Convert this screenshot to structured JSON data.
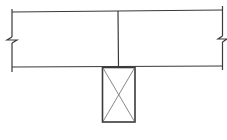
{
  "diagram": {
    "type": "structural-detail",
    "stroke_color": "#3a3a3a",
    "light_stroke_color": "#6a6a6a",
    "background": "#ffffff",
    "beam": {
      "left_x": 12,
      "right_x": 223,
      "top_left_y": 12,
      "top_right_y": 10,
      "bottom_y": 67,
      "center_joint_x": 118,
      "break_symbol_y_left": 40,
      "break_symbol_y_right": 39
    },
    "post": {
      "left_x": 102,
      "right_x": 135,
      "top_y": 67,
      "bottom_y": 122,
      "cross_marked": true
    }
  }
}
